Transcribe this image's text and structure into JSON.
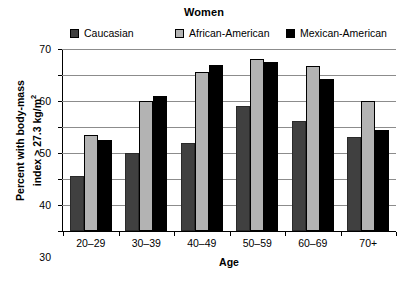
{
  "chart_data": {
    "type": "bar",
    "title": "Women",
    "xlabel": "Age",
    "ylabel_line1": "Percent with body-mass",
    "ylabel_line2_prefix": "index > 27.3 kg/m",
    "ylabel_line2_sup": "2",
    "categories": [
      "20–29",
      "30–39",
      "40–49",
      "50–59",
      "60–69",
      "70+"
    ],
    "yticks": [
      0,
      10,
      20,
      30,
      40,
      50,
      60,
      70
    ],
    "ylim": [
      0,
      70
    ],
    "grid": true,
    "legend_position": "top",
    "series": [
      {
        "name": "Caucasian",
        "color": "#404040",
        "values": [
          21,
          30,
          34,
          48,
          42.5,
          36
        ]
      },
      {
        "name": "African-American",
        "color": "#b3b3b3",
        "values": [
          37,
          50,
          61,
          66,
          63.5,
          50
        ]
      },
      {
        "name": "Mexican-American",
        "color": "#000000",
        "values": [
          35,
          52,
          64,
          65,
          58.5,
          39
        ]
      }
    ]
  }
}
